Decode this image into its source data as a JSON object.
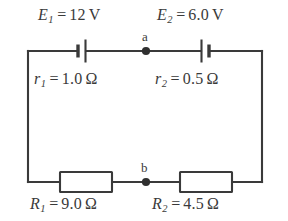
{
  "diagram": {
    "type": "circuit-schematic",
    "colors": {
      "background": "#ffffff",
      "wire": "#3a3a3a",
      "text": "#3a3a3a",
      "component_fill": "#ffffff"
    },
    "nodes": [
      {
        "id": "a",
        "label": "a",
        "position": "top-middle"
      },
      {
        "id": "b",
        "label": "b",
        "position": "bottom-middle"
      }
    ],
    "sources": [
      {
        "id": "E1",
        "symbol": "E",
        "subscript": "1",
        "equals": "=",
        "value": "12",
        "unit": "V",
        "text": "E₁ = 12 V",
        "branch": "top-left",
        "internal_resistance": {
          "symbol": "r",
          "subscript": "1",
          "equals": "=",
          "value": "1.0",
          "unit": "Ω",
          "text": "r₁ = 1.0 Ω"
        }
      },
      {
        "id": "E2",
        "symbol": "E",
        "subscript": "2",
        "equals": "=",
        "value": "6.0",
        "unit": "V",
        "text": "E₂ = 6.0 V",
        "branch": "top-right",
        "internal_resistance": {
          "symbol": "r",
          "subscript": "2",
          "equals": "=",
          "value": "0.5",
          "unit": "Ω",
          "text": "r₂ = 0.5 Ω"
        }
      }
    ],
    "resistors": [
      {
        "id": "R1",
        "symbol": "R",
        "subscript": "1",
        "equals": "=",
        "value": "9.0",
        "unit": "Ω",
        "text": "R₁ = 9.0 Ω",
        "branch": "bottom-left"
      },
      {
        "id": "R2",
        "symbol": "R",
        "subscript": "2",
        "equals": "=",
        "value": "4.5",
        "unit": "Ω",
        "text": "R₂ = 4.5 Ω",
        "branch": "bottom-right"
      }
    ]
  }
}
